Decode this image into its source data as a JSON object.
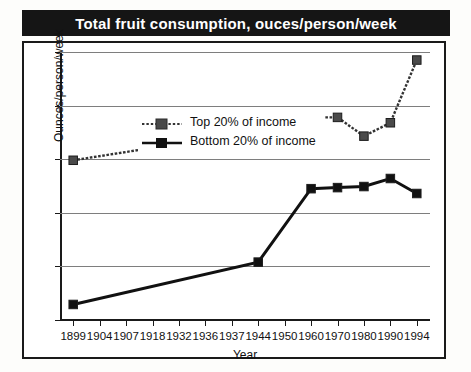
{
  "chart_data": {
    "type": "line",
    "title": "Total fruit consumption, ouces/person/week",
    "xlabel": "Year",
    "ylabel": "Ounces/person/week",
    "ylim": [
      0,
      50
    ],
    "yticks": [
      0,
      10,
      20,
      30,
      40,
      50
    ],
    "grid": true,
    "legend_position": "top-left inside plot",
    "categories": [
      "1899",
      "1904",
      "1907",
      "1918",
      "1932",
      "1936",
      "1937",
      "1944",
      "1950",
      "1960",
      "1970",
      "1980",
      "1990",
      "1994"
    ],
    "series": [
      {
        "name": "Top 20% of income",
        "marker": "square",
        "line_style": "dotted",
        "color": "#333333",
        "points": [
          {
            "x": "1899",
            "y": 29.8
          },
          {
            "x": "1944",
            "y": 35.2
          },
          {
            "x": "1960",
            "y": 37.8
          },
          {
            "x": "1970",
            "y": 37.8
          },
          {
            "x": "1980",
            "y": 34.3
          },
          {
            "x": "1990",
            "y": 36.8
          },
          {
            "x": "1994",
            "y": 48.5
          }
        ]
      },
      {
        "name": "Bottom 20% of income",
        "marker": "square",
        "line_style": "solid",
        "color": "#111111",
        "points": [
          {
            "x": "1899",
            "y": 2.9
          },
          {
            "x": "1944",
            "y": 10.8
          },
          {
            "x": "1960",
            "y": 24.5
          },
          {
            "x": "1970",
            "y": 24.7
          },
          {
            "x": "1980",
            "y": 24.9
          },
          {
            "x": "1990",
            "y": 26.4
          },
          {
            "x": "1994",
            "y": 23.6
          }
        ]
      }
    ]
  },
  "legend": {
    "items": [
      {
        "label": "Top 20% of income"
      },
      {
        "label": "Bottom 20% of income"
      }
    ]
  }
}
